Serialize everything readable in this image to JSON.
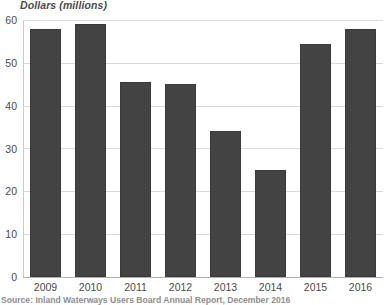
{
  "chart_data": {
    "type": "bar",
    "title": "Dollars (millions)",
    "subtitle": "",
    "xlabel": "",
    "ylabel": "Dollars (millions)",
    "categories": [
      "2009",
      "2010",
      "2011",
      "2012",
      "2013",
      "2014",
      "2015",
      "2016"
    ],
    "values": [
      58,
      59,
      45.5,
      45,
      34,
      25,
      54.5,
      58
    ],
    "series": [
      {
        "name": "Dollars (millions)",
        "values": [
          58,
          59,
          45.5,
          45,
          34,
          25,
          54.5,
          58
        ]
      }
    ],
    "ylim": [
      0,
      60
    ],
    "ytick_labels": [
      "0",
      "10",
      "20",
      "30",
      "40",
      "50",
      "60"
    ],
    "ytick_values": [
      0,
      10,
      20,
      30,
      40,
      50,
      60
    ],
    "grid": "horizontal",
    "legend": "none",
    "bar_color": "#434343",
    "gridline_color": "#d9d9d9",
    "axis_color": "#b0b0b0",
    "text_color": "#4a4a4a"
  },
  "source": {
    "note": "Source: Inland Waterways Users Board Annual Report, December 2016"
  }
}
